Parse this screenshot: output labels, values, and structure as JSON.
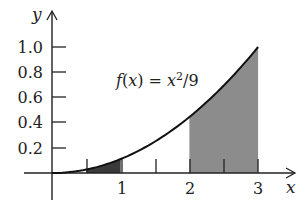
{
  "chart_data": {
    "type": "area",
    "title": "",
    "function_label": "f(x) = x²/9",
    "function": "x^2/9",
    "xlabel": "x",
    "ylabel": "y",
    "xlim": [
      0,
      3
    ],
    "ylim": [
      0,
      1.0
    ],
    "x_ticks": [
      0.5,
      1,
      1.5,
      2,
      2.5,
      3
    ],
    "x_tick_labels": [
      "",
      "1",
      "",
      "2",
      "",
      "3"
    ],
    "y_ticks": [
      0.2,
      0.4,
      0.6,
      0.8,
      1.0
    ],
    "y_tick_labels": [
      "0.2",
      "0.4",
      "0.6",
      "0.8",
      "1.0"
    ],
    "shaded_regions": [
      {
        "from": 0.5,
        "to": 1,
        "color": "#3a3a3a"
      },
      {
        "from": 2,
        "to": 3,
        "color": "#8c8c8c"
      }
    ],
    "curve": {
      "x": [
        0,
        0.5,
        1,
        1.5,
        2,
        2.5,
        3
      ],
      "y": [
        0,
        0.028,
        0.111,
        0.25,
        0.444,
        0.694,
        1.0
      ]
    },
    "grid": false,
    "legend": "none"
  },
  "labels": {
    "y_axis": "y",
    "x_axis": "x",
    "fn_prefix": "f(x) = x",
    "fn_exp": "2",
    "fn_suffix": "/9",
    "y_ticks": [
      "1.0",
      "0.8",
      "0.6",
      "0.4",
      "0.2"
    ],
    "x_ticks": [
      "1",
      "2",
      "3"
    ]
  }
}
